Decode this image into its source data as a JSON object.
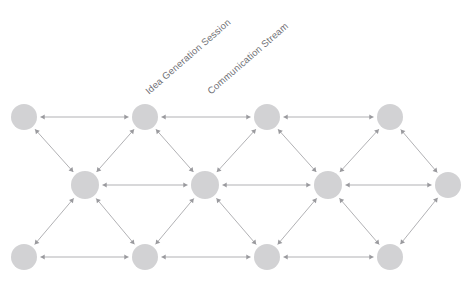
{
  "canvas": {
    "width": 473,
    "height": 286,
    "background": "#ffffff"
  },
  "labels": {
    "idea_generation": "Idea Generation Session",
    "communication_stream": "Communication Stream"
  },
  "style": {
    "node_fill": "#d2d2d4",
    "edge_stroke": "#a8a8ac",
    "arrow_fill": "#9a9a9e",
    "label_color": "#6e6e73",
    "node_radius": 13,
    "label_rotation_deg": -41
  },
  "chart_data": {
    "type": "diagram",
    "subtype": "triangular-lattice-network",
    "title": "",
    "node_count": 16,
    "edge_count": 29,
    "edge_style": "bidirectional-arrow",
    "rows": [
      {
        "name": "top-row",
        "y": 117,
        "node_ids": [
          "t1",
          "t2",
          "t3",
          "t4"
        ]
      },
      {
        "name": "middle-row",
        "y": 185,
        "node_ids": [
          "m1",
          "m2",
          "m3",
          "m4",
          "m5"
        ]
      },
      {
        "name": "bottom-row",
        "y": 257,
        "node_ids": [
          "b1",
          "b2",
          "b3",
          "b4"
        ]
      }
    ],
    "nodes": [
      {
        "id": "t1",
        "x": 24,
        "y": 117,
        "r": 13,
        "row": "top"
      },
      {
        "id": "t2",
        "x": 145,
        "y": 117,
        "r": 13,
        "row": "top"
      },
      {
        "id": "t3",
        "x": 267,
        "y": 117,
        "r": 13,
        "row": "top"
      },
      {
        "id": "t4",
        "x": 390,
        "y": 117,
        "r": 13,
        "row": "top"
      },
      {
        "id": "m1",
        "x": 85,
        "y": 185,
        "r": 14,
        "row": "middle"
      },
      {
        "id": "m2",
        "x": 205,
        "y": 185,
        "r": 14,
        "row": "middle"
      },
      {
        "id": "m3",
        "x": 328,
        "y": 185,
        "r": 14,
        "row": "middle"
      },
      {
        "id": "m4",
        "x": 448,
        "y": 185,
        "r": 13,
        "row": "middle"
      },
      {
        "id": "b1",
        "x": 24,
        "y": 257,
        "r": 13,
        "row": "bottom"
      },
      {
        "id": "b2",
        "x": 145,
        "y": 257,
        "r": 13,
        "row": "bottom"
      },
      {
        "id": "b3",
        "x": 267,
        "y": 257,
        "r": 13,
        "row": "bottom"
      },
      {
        "id": "b4",
        "x": 390,
        "y": 257,
        "r": 13,
        "row": "bottom"
      }
    ],
    "edges": [
      {
        "from": "t1",
        "to": "t2",
        "directed": "both"
      },
      {
        "from": "t2",
        "to": "t3",
        "directed": "both"
      },
      {
        "from": "t3",
        "to": "t4",
        "directed": "both"
      },
      {
        "from": "m1",
        "to": "m2",
        "directed": "both"
      },
      {
        "from": "m2",
        "to": "m3",
        "directed": "both"
      },
      {
        "from": "m3",
        "to": "m4",
        "directed": "both"
      },
      {
        "from": "b1",
        "to": "b2",
        "directed": "both"
      },
      {
        "from": "b2",
        "to": "b3",
        "directed": "both"
      },
      {
        "from": "b3",
        "to": "b4",
        "directed": "both"
      },
      {
        "from": "t1",
        "to": "m1",
        "directed": "both"
      },
      {
        "from": "t2",
        "to": "m1",
        "directed": "both"
      },
      {
        "from": "t2",
        "to": "m2",
        "directed": "both"
      },
      {
        "from": "t3",
        "to": "m2",
        "directed": "both"
      },
      {
        "from": "t3",
        "to": "m3",
        "directed": "both"
      },
      {
        "from": "t4",
        "to": "m3",
        "directed": "both"
      },
      {
        "from": "t4",
        "to": "m4",
        "directed": "both"
      },
      {
        "from": "m1",
        "to": "b1",
        "directed": "both"
      },
      {
        "from": "m1",
        "to": "b2",
        "directed": "both"
      },
      {
        "from": "m2",
        "to": "b2",
        "directed": "both"
      },
      {
        "from": "m2",
        "to": "b3",
        "directed": "both"
      },
      {
        "from": "m3",
        "to": "b3",
        "directed": "both"
      },
      {
        "from": "m3",
        "to": "b4",
        "directed": "both"
      },
      {
        "from": "m4",
        "to": "b4",
        "directed": "both"
      }
    ],
    "annotations": [
      {
        "text": "Idea Generation Session",
        "x": 143,
        "y": 88,
        "rotation": -41
      },
      {
        "text": "Communication Stream",
        "x": 205,
        "y": 88,
        "rotation": -41
      }
    ]
  }
}
